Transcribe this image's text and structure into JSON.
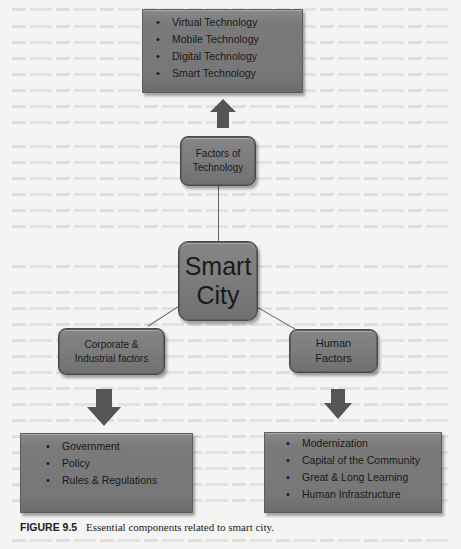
{
  "diagram": {
    "central": {
      "label_line1": "Smart",
      "label_line2": "City"
    },
    "technology_factors": {
      "label_line1": "Factors of",
      "label_line2": "Technology",
      "items": [
        "Virtual Technology",
        "Mobile Technology",
        "Digital Technology",
        "Smart Technology"
      ]
    },
    "corporate_factors": {
      "label_line1": "Corporate &",
      "label_line2": "Industrial factors",
      "items": [
        "Government",
        "Policy",
        "Rules & Regulations"
      ]
    },
    "human_factors": {
      "label_line1": "Human",
      "label_line2": "Factors",
      "items": [
        "Modernization",
        "Capital of the Community",
        "Great & Long Learning",
        "Human Infrastructure"
      ]
    },
    "colors": {
      "box_fill": "#7a7a7a",
      "arrow": "#555555",
      "connector": "#666666",
      "text": "#1a1a1a"
    }
  },
  "caption": {
    "figure_number": "FIGURE 9.5",
    "text": "Essential components related to smart city."
  }
}
